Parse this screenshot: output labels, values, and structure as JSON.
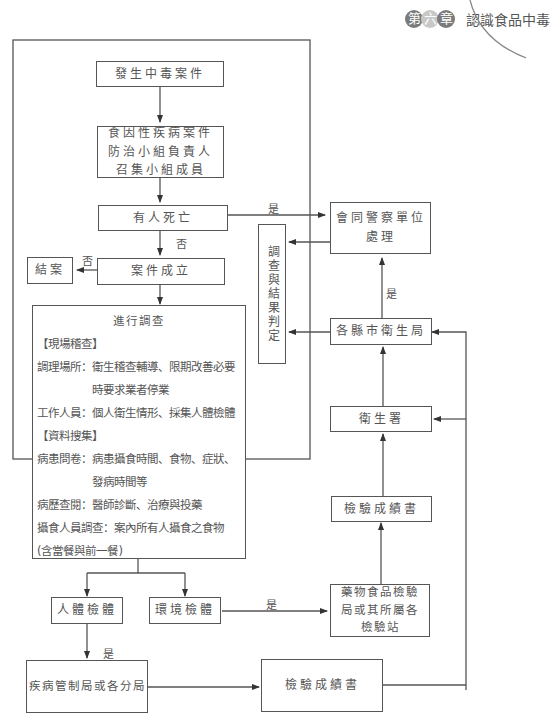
{
  "header": {
    "chapter_chars": [
      "第",
      "六",
      "章"
    ],
    "title": "認識食品中毒"
  },
  "nodes": {
    "start": "發生中毒案件",
    "team": "食因性疾病案件防治小組負責人召集小組成員",
    "death": "有人死亡",
    "case_established": "案件成立",
    "closed": "結案",
    "police": "會同警察單位處理",
    "investigation_result": "調查與結果判定",
    "county_health": "各縣市衛生局",
    "health_dept": "衛生署",
    "report_upper": "檢驗成績書",
    "fda_lab": "藥物食品檢驗局或其所屬各檢驗站",
    "human_specimen": "人體檢體",
    "env_specimen": "環境檢體",
    "cdc": "疾病管制局或各分局",
    "report_lower": "檢驗成績書"
  },
  "investigation": {
    "title": "進行調查",
    "section1": "【現場稽查】",
    "rows1": [
      {
        "k": "調理場所：",
        "v": "衛生稽查輔導、限期改善必要時要求業者停業"
      },
      {
        "k": "工作人員：",
        "v": "個人衛生情形、採集人體檢體"
      }
    ],
    "section2": "【資料搜集】",
    "rows2": [
      {
        "k": "病患問卷：",
        "v": "病患攝食時間、食物、症狀、發病時間等"
      },
      {
        "k": "病歷查閱：",
        "v": "醫師診斷、治療與投藥"
      },
      {
        "k": "攝食人員調查：",
        "v": "案內所有人攝食之食物"
      }
    ],
    "footnote": "(含當餐與前一餐)"
  },
  "edge_labels": {
    "death_yes": "是",
    "death_no": "否",
    "case_no": "否",
    "county_yes": "是",
    "env_yes": "是",
    "human_yes": "是"
  }
}
